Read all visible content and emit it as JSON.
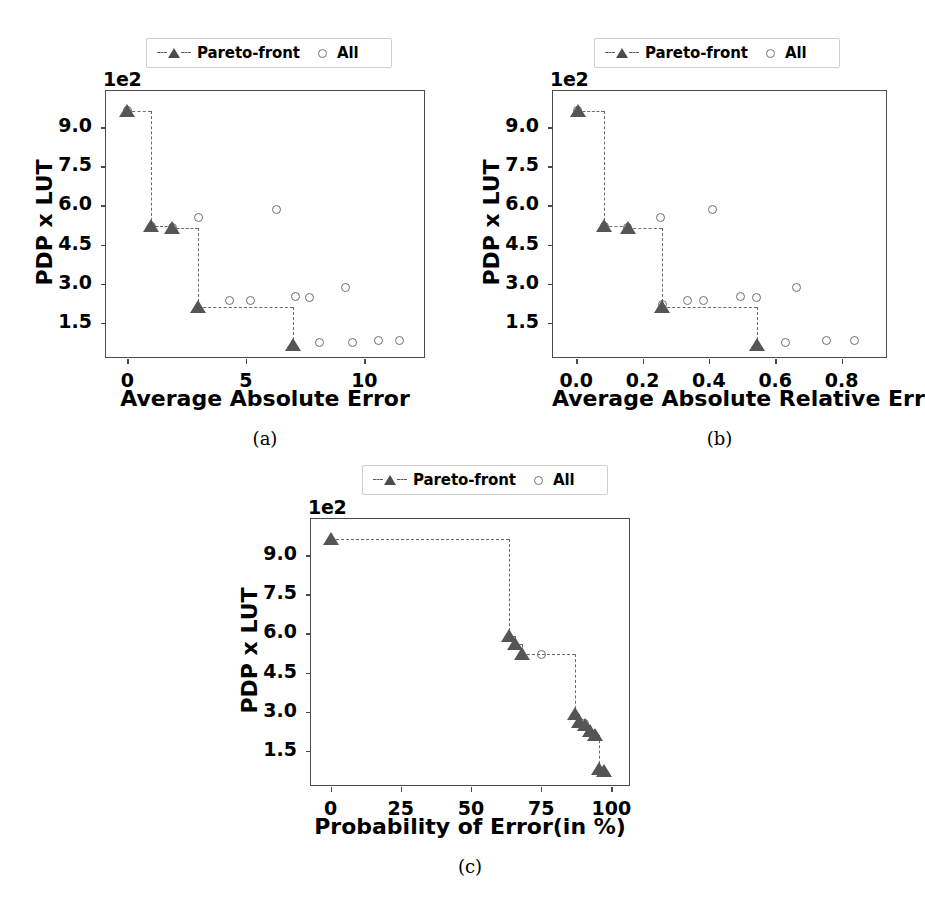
{
  "figure": {
    "background": "#ffffff",
    "marker_color": "#555555",
    "circle_color": "#6e6e6e",
    "line_color": "#6b6b6b",
    "axis_color": "#4a4a4a"
  },
  "legend": {
    "pareto_label": "Pareto-front",
    "all_label": "All",
    "pareto_icon": "dashed-line-triangle-marker",
    "all_icon": "open-circle-marker"
  },
  "captions": {
    "a": "(a)",
    "b": "(b)",
    "c": "(c)"
  },
  "chart_data": [
    {
      "type": "scatter",
      "id": "a",
      "title": "",
      "xlabel": "Average Absolute Error",
      "ylabel": "PDP x LUT",
      "y_exponent_label": "1e2",
      "xlim": [
        -0.9,
        12.6
      ],
      "ylim": [
        0.1,
        10.4
      ],
      "xticks": [
        0,
        5,
        10
      ],
      "xtick_labels": [
        "0",
        "5",
        "10"
      ],
      "yticks": [
        1.5,
        3.0,
        4.5,
        6.0,
        7.5,
        9.0
      ],
      "ytick_labels": [
        "1.5",
        "3.0",
        "4.5",
        "6.0",
        "7.5",
        "9.0"
      ],
      "grid": false,
      "legend_position": "above-center",
      "series": [
        {
          "name": "All",
          "marker": "open-circle",
          "x": [
            0.0,
            1.0,
            1.9,
            3.0,
            4.3,
            5.2,
            6.3,
            7.1,
            7.7,
            8.1,
            9.2,
            9.5,
            10.6,
            11.5
          ],
          "y": [
            9.65,
            5.2,
            5.15,
            5.55,
            2.35,
            2.35,
            5.85,
            2.5,
            2.45,
            0.75,
            2.85,
            0.75,
            0.8,
            0.8
          ]
        },
        {
          "name": "Pareto-front",
          "marker": "triangle",
          "x": [
            0.0,
            1.0,
            1.9,
            3.0,
            7.0
          ],
          "y": [
            9.65,
            5.2,
            5.15,
            2.1,
            0.65
          ]
        }
      ],
      "pareto_step_x": [
        0.0,
        1.0,
        1.9,
        3.0,
        7.0
      ],
      "pareto_step_y": [
        9.65,
        5.2,
        5.15,
        2.1,
        0.65
      ]
    },
    {
      "type": "scatter",
      "id": "b",
      "title": "",
      "xlabel": "Average Absolute Relative Error",
      "ylabel": "PDP x LUT",
      "y_exponent_label": "1e2",
      "xlim": [
        -0.07,
        0.94
      ],
      "ylim": [
        0.1,
        10.4
      ],
      "xticks": [
        0.0,
        0.2,
        0.4,
        0.6,
        0.8
      ],
      "xtick_labels": [
        "0.0",
        "0.2",
        "0.4",
        "0.6",
        "0.8"
      ],
      "yticks": [
        1.5,
        3.0,
        4.5,
        6.0,
        7.5,
        9.0
      ],
      "ytick_labels": [
        "1.5",
        "3.0",
        "4.5",
        "6.0",
        "7.5",
        "9.0"
      ],
      "grid": false,
      "legend_position": "above-center",
      "series": [
        {
          "name": "All",
          "marker": "open-circle",
          "x": [
            0.005,
            0.085,
            0.155,
            0.255,
            0.26,
            0.335,
            0.385,
            0.41,
            0.495,
            0.545,
            0.63,
            0.665,
            0.755,
            0.84
          ],
          "y": [
            9.65,
            5.2,
            5.15,
            5.55,
            2.2,
            2.35,
            2.35,
            5.85,
            2.5,
            2.45,
            0.75,
            2.85,
            0.8,
            0.8
          ]
        },
        {
          "name": "Pareto-front",
          "marker": "triangle",
          "x": [
            0.005,
            0.085,
            0.155,
            0.26,
            0.545
          ],
          "y": [
            9.65,
            5.2,
            5.15,
            2.1,
            0.65
          ]
        }
      ],
      "pareto_step_x": [
        0.005,
        0.085,
        0.155,
        0.26,
        0.545
      ],
      "pareto_step_y": [
        9.65,
        5.2,
        5.15,
        2.1,
        0.65
      ]
    },
    {
      "type": "scatter",
      "id": "c",
      "title": "",
      "xlabel": "Probability of Error(in %)",
      "ylabel": "PDP x LUT",
      "y_exponent_label": "1e2",
      "xlim": [
        -7,
        107
      ],
      "ylim": [
        0.1,
        10.4
      ],
      "xticks": [
        0,
        25,
        50,
        75,
        100
      ],
      "xtick_labels": [
        "0",
        "25",
        "50",
        "75",
        "100"
      ],
      "yticks": [
        1.5,
        3.0,
        4.5,
        6.0,
        7.5,
        9.0
      ],
      "ytick_labels": [
        "1.5",
        "3.0",
        "4.5",
        "6.0",
        "7.5",
        "9.0"
      ],
      "grid": false,
      "legend_position": "above-center",
      "series": [
        {
          "name": "All",
          "marker": "open-circle",
          "x": [
            75.0,
            90.5
          ],
          "y": [
            5.2,
            2.55
          ]
        },
        {
          "name": "Pareto-front",
          "marker": "triangle",
          "x": [
            0.0,
            63.5,
            65.5,
            68.0,
            87.0,
            88.5,
            90.5,
            92.5,
            94.0,
            95.5,
            97.5
          ],
          "y": [
            9.65,
            5.9,
            5.6,
            5.2,
            2.9,
            2.6,
            2.5,
            2.25,
            2.1,
            0.8,
            0.7
          ]
        }
      ],
      "pareto_step_x": [
        0.0,
        63.5,
        65.5,
        68.0,
        87.0,
        88.5,
        90.5,
        92.5,
        94.0,
        95.5,
        97.5
      ],
      "pareto_step_y": [
        9.65,
        5.9,
        5.6,
        5.2,
        2.9,
        2.6,
        2.5,
        2.25,
        2.1,
        0.8,
        0.7
      ]
    }
  ]
}
